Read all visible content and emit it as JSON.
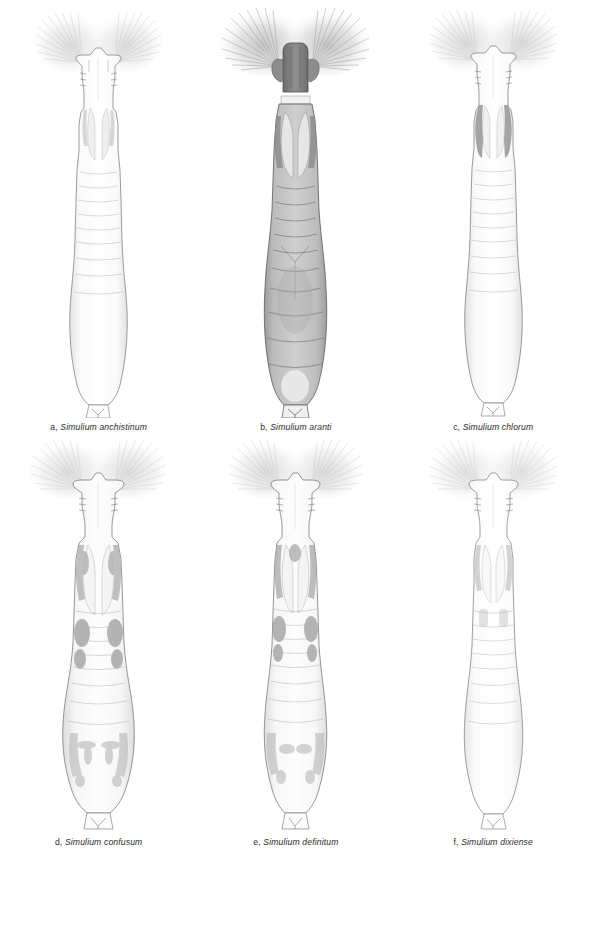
{
  "figure": {
    "type": "scientific-illustration-plate",
    "layout": "2 rows x 3 columns",
    "panel_count": 6,
    "background_color": "#ffffff",
    "ink_color": "#6f6f6f",
    "footer_text": ""
  },
  "panels": [
    {
      "letter": "a,",
      "genus": "Simulium",
      "species": "anchistinum",
      "caption": "a, Simulium anchistinum",
      "pigmentation": "very pale",
      "body_tone": "#fbfbfb",
      "outline_tone": "#7d7d7d",
      "thorax_patch_tone": "#c9c9c9",
      "fan_tone": "#cfcfcf",
      "abdomen_width": 30,
      "fan_size": "medium"
    },
    {
      "letter": "b,",
      "genus": "Simulium",
      "species": "aranti",
      "caption": "b, Simulium aranti",
      "pigmentation": "dark",
      "body_tone": "#b3b3b3",
      "outline_tone": "#5a5a5a",
      "thorax_patch_tone": "#8a8a8a",
      "fan_tone": "#b9b9b9",
      "abdomen_width": 34,
      "fan_size": "large"
    },
    {
      "letter": "c,",
      "genus": "Simulium",
      "species": "chlorum",
      "caption": "c, Simulium chlorum",
      "pigmentation": "pale with dark lateral thoracic bands",
      "body_tone": "#fafafa",
      "outline_tone": "#797979",
      "thorax_patch_tone": "#9a9a9a",
      "fan_tone": "#cbcbcb",
      "abdomen_width": 31,
      "fan_size": "medium"
    },
    {
      "letter": "d,",
      "genus": "Simulium",
      "species": "confusum",
      "caption": "d, Simulium confusum",
      "pigmentation": "mottled grey",
      "body_tone": "#f4f4f4",
      "outline_tone": "#767676",
      "thorax_patch_tone": "#a8a8a8",
      "fan_tone": "#cdcdcd",
      "abdomen_width": 35,
      "fan_size": "medium"
    },
    {
      "letter": "e,",
      "genus": "Simulium",
      "species": "definitum",
      "caption": "e, Simulium definitum",
      "pigmentation": "mottled grey",
      "body_tone": "#f5f5f5",
      "outline_tone": "#767676",
      "thorax_patch_tone": "#a3a3a3",
      "fan_tone": "#cacaca",
      "abdomen_width": 31,
      "fan_size": "medium"
    },
    {
      "letter": "f,",
      "genus": "Simulium",
      "species": "dixiense",
      "caption": "f, Simulium dixiense",
      "pigmentation": "very pale",
      "body_tone": "#fcfcfc",
      "outline_tone": "#818181",
      "thorax_patch_tone": "#c4c4c4",
      "fan_tone": "#d2d2d2",
      "abdomen_width": 30,
      "fan_size": "medium"
    }
  ]
}
